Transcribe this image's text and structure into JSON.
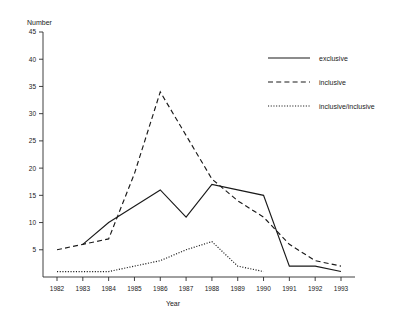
{
  "chart_data": {
    "type": "line",
    "title": "",
    "ylabel": "Number",
    "xlabel": "Year",
    "categories": [
      "1982",
      "1983",
      "1984",
      "1985",
      "1986",
      "1987",
      "1988",
      "1989",
      "1990",
      "1991",
      "1992",
      "1993"
    ],
    "x": [
      1982,
      1983,
      1984,
      1985,
      1986,
      1987,
      1988,
      1989,
      1990,
      1991,
      1992,
      1993
    ],
    "ylim": [
      0,
      45
    ],
    "yticks": [
      0,
      5,
      10,
      15,
      20,
      25,
      30,
      35,
      40,
      45
    ],
    "ytick_labels": [
      "",
      "5",
      "10",
      "15",
      "20",
      "25",
      "30",
      "35",
      "40",
      "45"
    ],
    "grid": false,
    "legend_position": "upper right",
    "series": [
      {
        "name": "exclusive",
        "style": "solid",
        "values": [
          null,
          6,
          10,
          13,
          16,
          11,
          17,
          16,
          15,
          2,
          2,
          1
        ]
      },
      {
        "name": "inclusive",
        "style": "dashed",
        "values": [
          5,
          6,
          7,
          19,
          34,
          26,
          18,
          14,
          11,
          6,
          3,
          2
        ]
      },
      {
        "name": "inclusive/inclusive",
        "style": "dotted",
        "values": [
          1,
          1,
          1,
          2,
          3,
          5,
          6.5,
          2,
          1,
          null,
          null,
          null
        ]
      }
    ]
  },
  "axes": {
    "y_axis_title": "Number",
    "x_axis_title": "Year"
  },
  "legend": {
    "items": [
      {
        "label": "exclusive",
        "style": "solid"
      },
      {
        "label": "inclusive",
        "style": "dashed"
      },
      {
        "label": "inclusive/inclusive",
        "style": "dotted"
      }
    ]
  }
}
